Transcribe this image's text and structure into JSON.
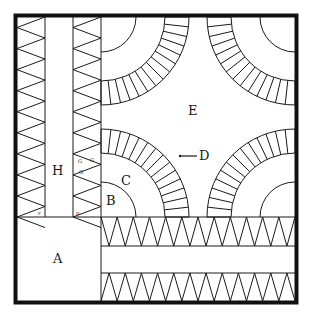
{
  "diagram": {
    "colors": {
      "line": "#1a1a1a",
      "background": "#ffffff"
    },
    "labels": {
      "A": "A",
      "B": "B",
      "C": "C",
      "D": "D",
      "E": "E",
      "H": "H",
      "G1": "G",
      "G2": "G",
      "G3": "G",
      "F": "F",
      "H_small": "H"
    },
    "sections": [
      {
        "id": "A",
        "description": "corner square"
      },
      {
        "id": "B",
        "description": "inner quarter circle"
      },
      {
        "id": "C",
        "description": "quarter circle ring"
      },
      {
        "id": "D",
        "description": "pieced arc of wedges"
      },
      {
        "id": "E",
        "description": "center background"
      },
      {
        "id": "H",
        "description": "vertical sashing strip"
      },
      {
        "id": "G",
        "description": "sawtooth triangles"
      }
    ],
    "pieced_arc_wedges_per_quarter": 14,
    "sawtooth_triangles_per_strip": 9
  }
}
